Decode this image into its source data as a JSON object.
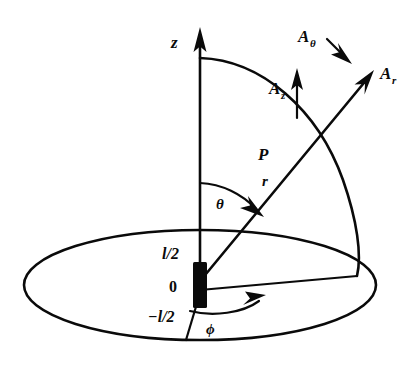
{
  "figure": {
    "background_color": "#ffffff",
    "ink_color": "#0a0a0a",
    "width": 419,
    "height": 368
  },
  "axes": {
    "z_axis_label": "z",
    "origin_label": "0",
    "upper_end_label": "l/2",
    "lower_end_label": "−l/2"
  },
  "point": {
    "label": "P"
  },
  "coordinates": {
    "radial_label": "r",
    "polar_angle_label": "θ",
    "azimuth_angle_label": "ϕ"
  },
  "vectors": [
    {
      "base": "A",
      "sub": "θ",
      "name": "A-theta"
    },
    {
      "base": "A",
      "sub": "z",
      "name": "A-z"
    },
    {
      "base": "A",
      "sub": "r",
      "name": "A-r"
    }
  ]
}
